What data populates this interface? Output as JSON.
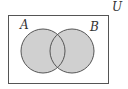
{
  "diagram": {
    "type": "venn",
    "universe_label": "U",
    "sets": [
      {
        "label": "A",
        "shaded": true
      },
      {
        "label": "B",
        "shaded": true
      }
    ],
    "shaded_region": "A ∪ B",
    "colors": {
      "shade": "#d0d0d0",
      "stroke": "#555555",
      "background": "#ffffff"
    }
  }
}
